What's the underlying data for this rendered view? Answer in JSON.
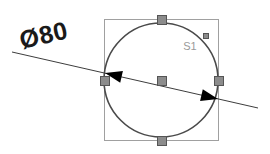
{
  "canvas": {
    "width": 270,
    "height": 154,
    "background_color": "#ffffff"
  },
  "drawing": {
    "title": "diameter-dimension-sketch",
    "dimension": {
      "label": "Ø80",
      "symbol": "Ø",
      "value": "80",
      "label_color": "#1a1a1a",
      "label_x": 44,
      "label_y": 37,
      "label_rotation": -13,
      "label_font_size": 25,
      "leader": {
        "x1": 12,
        "y1": 52,
        "x2": 258,
        "y2": 108,
        "color": "#3d3d3d",
        "width": 1
      },
      "arrowheads": [
        {
          "name": "left-arrowhead",
          "tip_x": 105,
          "tip_y": 73,
          "rotation": 193,
          "length": 17,
          "half_width": 6,
          "color": "#000000"
        },
        {
          "name": "right-arrowhead",
          "tip_x": 218,
          "tip_y": 99,
          "rotation": 13,
          "length": 17,
          "half_width": 6,
          "color": "#000000"
        }
      ]
    },
    "bounding_box": {
      "x": 104,
      "y": 19,
      "width": 114,
      "height": 121,
      "stroke_color": "#a0a0a0",
      "stroke_width": 1,
      "fill": "none"
    },
    "circle": {
      "center_x": 161,
      "center_y": 80,
      "radius": 57,
      "diameter_value": "80",
      "stroke_color": "#4a4a4a",
      "stroke_width": 1.6,
      "fill": "none"
    },
    "entity_label": {
      "text": "S1",
      "x": 190,
      "y": 47,
      "color": "#9a9a9a",
      "font_size": 11
    },
    "grips": [
      {
        "name": "grip-top",
        "x": 161,
        "y": 19,
        "size": 9
      },
      {
        "name": "grip-bottom",
        "x": 161,
        "y": 140,
        "size": 9
      },
      {
        "name": "grip-left",
        "x": 104,
        "y": 80,
        "size": 9
      },
      {
        "name": "grip-right",
        "x": 218,
        "y": 80,
        "size": 9
      },
      {
        "name": "grip-center",
        "x": 161,
        "y": 80,
        "size": 9
      },
      {
        "name": "grip-quadrant-upper-right",
        "x": 205,
        "y": 35,
        "size": 5
      }
    ],
    "grip_style": {
      "fill_color": "#8c8c8c",
      "stroke_color": "#555555",
      "stroke_width": 1
    }
  }
}
